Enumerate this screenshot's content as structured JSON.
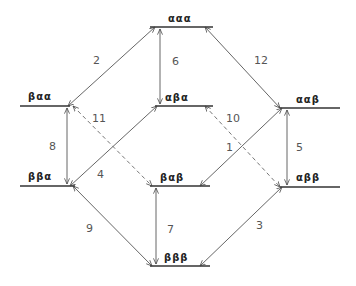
{
  "diagram": {
    "levels": [
      {
        "id": "aaa",
        "label": "ααα",
        "x1": 150,
        "x2": 213,
        "y": 27,
        "lx": 168,
        "ly": 22
      },
      {
        "id": "baa",
        "label": "βαα",
        "x1": 20,
        "x2": 70,
        "y": 106,
        "lx": 28,
        "ly": 100
      },
      {
        "id": "aba",
        "label": "αβα",
        "x1": 155,
        "x2": 213,
        "y": 106,
        "lx": 165,
        "ly": 101
      },
      {
        "id": "aab",
        "label": "ααβ",
        "x1": 280,
        "x2": 340,
        "y": 108,
        "lx": 296,
        "ly": 103
      },
      {
        "id": "bba",
        "label": "ββα",
        "x1": 20,
        "x2": 75,
        "y": 186,
        "lx": 28,
        "ly": 180
      },
      {
        "id": "bab",
        "label": "βαβ",
        "x1": 150,
        "x2": 210,
        "y": 186,
        "lx": 160,
        "ly": 181
      },
      {
        "id": "abb",
        "label": "αββ",
        "x1": 280,
        "x2": 340,
        "y": 187,
        "lx": 296,
        "ly": 181
      },
      {
        "id": "bbb",
        "label": "βββ",
        "x1": 150,
        "x2": 210,
        "y": 266,
        "lx": 164,
        "ly": 261
      }
    ],
    "transitions": [
      {
        "num": "1",
        "x1": 282,
        "y1": 108,
        "x2": 200,
        "y2": 186,
        "dashed": false,
        "lx": 226,
        "ly": 151
      },
      {
        "num": "2",
        "x1": 155,
        "y1": 27,
        "x2": 68,
        "y2": 106,
        "dashed": false,
        "lx": 93,
        "ly": 64
      },
      {
        "num": "3",
        "x1": 282,
        "y1": 187,
        "x2": 200,
        "y2": 266,
        "dashed": false,
        "lx": 256,
        "ly": 229
      },
      {
        "num": "4",
        "x1": 157,
        "y1": 106,
        "x2": 70,
        "y2": 186,
        "dashed": false,
        "lx": 97,
        "ly": 178
      },
      {
        "num": "5",
        "x1": 287,
        "y1": 110,
        "x2": 287,
        "y2": 185,
        "dashed": false,
        "lx": 296,
        "ly": 151
      },
      {
        "num": "6",
        "x1": 160,
        "y1": 29,
        "x2": 160,
        "y2": 104,
        "dashed": false,
        "lx": 172,
        "ly": 65
      },
      {
        "num": "7",
        "x1": 156,
        "y1": 188,
        "x2": 156,
        "y2": 264,
        "dashed": false,
        "lx": 167,
        "ly": 233
      },
      {
        "num": "8",
        "x1": 67,
        "y1": 108,
        "x2": 67,
        "y2": 184,
        "dashed": false,
        "lx": 49,
        "ly": 150
      },
      {
        "num": "9",
        "x1": 73,
        "y1": 186,
        "x2": 152,
        "y2": 266,
        "dashed": false,
        "lx": 86,
        "ly": 232
      },
      {
        "num": "10",
        "x1": 205,
        "y1": 106,
        "x2": 280,
        "y2": 187,
        "dashed": true,
        "lx": 226,
        "ly": 122
      },
      {
        "num": "11",
        "x1": 73,
        "y1": 106,
        "x2": 152,
        "y2": 186,
        "dashed": true,
        "lx": 92,
        "ly": 122
      },
      {
        "num": "12",
        "x1": 205,
        "y1": 27,
        "x2": 280,
        "y2": 108,
        "dashed": false,
        "lx": 254,
        "ly": 64
      }
    ]
  }
}
